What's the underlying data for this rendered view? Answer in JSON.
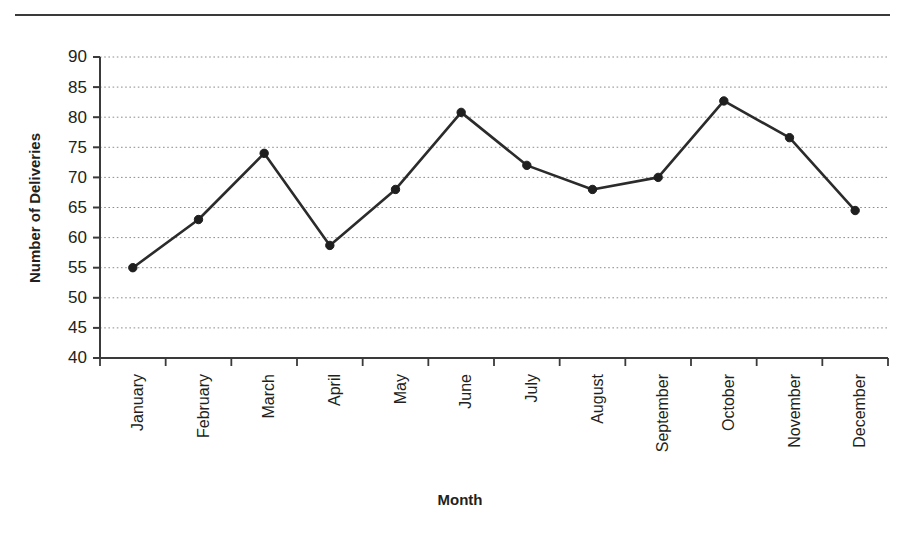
{
  "chart_data": {
    "type": "line",
    "title": "",
    "xlabel": "Month",
    "ylabel": "Number of Deliveries",
    "categories": [
      "January",
      "February",
      "March",
      "April",
      "May",
      "June",
      "July",
      "August",
      "September",
      "October",
      "November",
      "December"
    ],
    "values": [
      55,
      63,
      74,
      58.7,
      68,
      80.8,
      72,
      68,
      70,
      82.7,
      76.6,
      64.5
    ],
    "series": [
      {
        "name": "Number of Deliveries",
        "values": [
          55,
          63,
          74,
          58.7,
          68,
          80.8,
          72,
          68,
          70,
          82.7,
          76.6,
          64.5
        ]
      }
    ],
    "ylim": [
      40,
      90
    ],
    "ytick_labels": [
      "40",
      "45",
      "50",
      "55",
      "60",
      "65",
      "70",
      "75",
      "80",
      "85",
      "90"
    ],
    "ytick_values": [
      40,
      45,
      50,
      55,
      60,
      65,
      70,
      75,
      80,
      85,
      90
    ],
    "grid": "horizontal-dotted",
    "legend": "none",
    "line_color": "#2b2b2b",
    "marker": "circle",
    "marker_color": "#1f1f1f"
  }
}
